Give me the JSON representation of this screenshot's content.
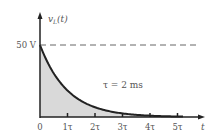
{
  "chart_data": {
    "type": "area",
    "title": "",
    "ylabel": "v_L(t)",
    "ylabel_main": "v",
    "ylabel_sub": "L",
    "ylabel_arg": "(t)",
    "xlabel": "t",
    "initial_value_label": "50 V",
    "initial_value": 50,
    "annotation": "τ = 2 ms",
    "tau_ms": 2,
    "x_tick_labels": [
      "0",
      "1τ",
      "2τ",
      "3τ",
      "4τ",
      "5τ"
    ],
    "x": [
      0,
      1,
      2,
      3,
      4,
      5
    ],
    "series": [
      {
        "name": "v_L(t) = 50 e^(-t/τ)",
        "values": [
          50,
          18.4,
          6.77,
          2.49,
          0.92,
          0.34
        ]
      }
    ],
    "ylim": [
      0,
      50
    ],
    "xlim": [
      0,
      5
    ],
    "grid": false,
    "dashed_reference_line_at": 50
  },
  "colors": {
    "curve": "#222222",
    "fill": "#d9d9d9",
    "axis": "#222222",
    "dashed": "#666666",
    "text": "#555555"
  }
}
